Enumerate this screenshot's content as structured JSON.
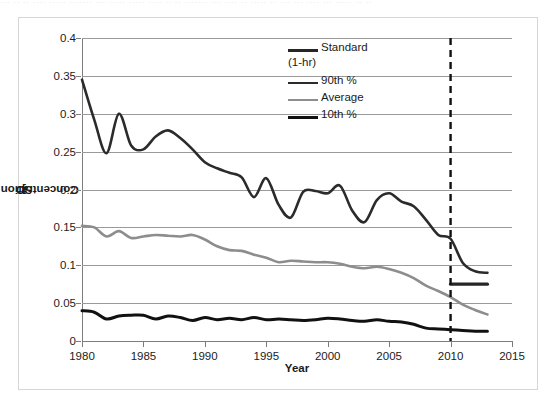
{
  "top_strip": {
    "ghost_text": "··· ·· ·· ···· ····· ······· ··· ····· ····· ···· ·· ·· ······· ··· ···· ·· ····· ·· ··· ··· ···· ··· ····· ·· ··"
  },
  "colors": {
    "standard": "#262626",
    "p90": "#2b2b2b",
    "average": "#8d8d8d",
    "p10": "#111111",
    "gridline": "#9a9a9a",
    "axis": "#7d7d7d",
    "border": "#d6d6d6",
    "background": "#ffffff"
  },
  "legend": {
    "position": "inside-top-center",
    "items": [
      {
        "label": "Standard",
        "sublabel": "(1-hr)",
        "color": "#262626",
        "width": 3.2,
        "name": "standard"
      },
      {
        "label": "90th %",
        "sublabel": "",
        "color": "#2b2b2b",
        "width": 2.6,
        "name": "p90"
      },
      {
        "label": "Average",
        "sublabel": "",
        "color": "#8d8d8d",
        "width": 2.6,
        "name": "average"
      },
      {
        "label": "10th %",
        "sublabel": "",
        "color": "#111111",
        "width": 3.0,
        "name": "p10"
      }
    ]
  },
  "chart_data": {
    "type": "line",
    "title": "",
    "xlabel": "Year",
    "ylabel": "SO2 Concentration [ppmv]",
    "ylabel_parts": {
      "prefix": "SO",
      "sub": "2",
      "mid": " Concentration [ppm",
      "sub2": "v",
      "suffix": "]"
    },
    "xlim": [
      1980,
      2015
    ],
    "ylim": [
      0,
      0.4
    ],
    "xticks": [
      1980,
      1985,
      1990,
      1995,
      2000,
      2005,
      2010,
      2015
    ],
    "xtick_labels": [
      "1980",
      "1985",
      "1990",
      "1995",
      "2000",
      "2005",
      "2010",
      "2015"
    ],
    "yticks": [
      0,
      0.05,
      0.1,
      0.15,
      0.2,
      0.25,
      0.3,
      0.35,
      0.4
    ],
    "ytick_labels": [
      "0",
      "0.05",
      "0.1",
      "0.15",
      "0.2",
      "0.25",
      "0.3",
      "0.35",
      "0.4"
    ],
    "grid": "horizontal",
    "annotations": [
      {
        "type": "vline",
        "x": 2010,
        "style": "dashed",
        "color": "#101010",
        "width": 2.4,
        "name": "standard-change-2010"
      }
    ],
    "x": [
      1980,
      1981,
      1982,
      1983,
      1984,
      1985,
      1986,
      1987,
      1988,
      1989,
      1990,
      1991,
      1992,
      1993,
      1994,
      1995,
      1996,
      1997,
      1998,
      1999,
      2000,
      2001,
      2002,
      2003,
      2004,
      2005,
      2006,
      2007,
      2008,
      2009,
      2010,
      2011,
      2012,
      2013
    ],
    "series": [
      {
        "name": "Standard (1-hr)",
        "color": "#262626",
        "width": 3.2,
        "x": [
          2010,
          2013
        ],
        "values": [
          0.075,
          0.075
        ]
      },
      {
        "name": "90th %",
        "color": "#2b2b2b",
        "width": 2.6,
        "values": [
          0.345,
          0.292,
          0.248,
          0.3,
          0.258,
          0.253,
          0.27,
          0.278,
          0.268,
          0.253,
          0.236,
          0.228,
          0.222,
          0.216,
          0.19,
          0.215,
          0.18,
          0.163,
          0.197,
          0.198,
          0.195,
          0.205,
          0.172,
          0.157,
          0.186,
          0.195,
          0.184,
          0.178,
          0.16,
          0.14,
          0.135,
          0.103,
          0.092,
          0.09
        ]
      },
      {
        "name": "Average",
        "color": "#8d8d8d",
        "width": 2.6,
        "values": [
          0.152,
          0.15,
          0.138,
          0.145,
          0.136,
          0.138,
          0.14,
          0.139,
          0.138,
          0.14,
          0.134,
          0.125,
          0.12,
          0.119,
          0.114,
          0.11,
          0.104,
          0.106,
          0.105,
          0.104,
          0.104,
          0.102,
          0.098,
          0.096,
          0.098,
          0.095,
          0.09,
          0.083,
          0.073,
          0.066,
          0.058,
          0.048,
          0.041,
          0.035
        ]
      },
      {
        "name": "10th %",
        "color": "#111111",
        "width": 3.0,
        "values": [
          0.04,
          0.038,
          0.029,
          0.033,
          0.034,
          0.034,
          0.029,
          0.033,
          0.031,
          0.027,
          0.031,
          0.028,
          0.03,
          0.028,
          0.031,
          0.028,
          0.029,
          0.028,
          0.027,
          0.028,
          0.03,
          0.029,
          0.027,
          0.026,
          0.028,
          0.026,
          0.025,
          0.022,
          0.017,
          0.016,
          0.015,
          0.014,
          0.013,
          0.013
        ]
      }
    ]
  }
}
